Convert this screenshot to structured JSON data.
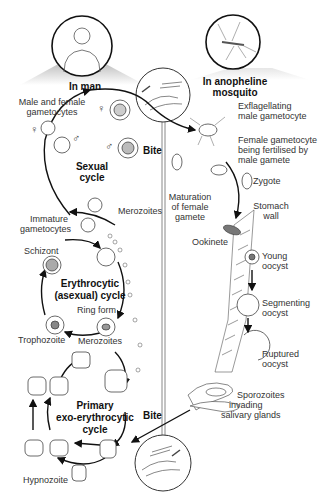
{
  "headers": {
    "man": "In man",
    "mosquito_line1": "In anopheline",
    "mosquito_line2": "mosquito"
  },
  "cycles": {
    "sexual_1": "Sexual",
    "sexual_2": "cycle",
    "erythro_1": "Erythrocytic",
    "erythro_2": "(asexual) cycle",
    "primary_1": "Primary",
    "primary_2": "exo-erythrocytic",
    "primary_3": "cycle"
  },
  "labels": {
    "gametocytes_1": "Male and female",
    "gametocytes_2": "gametocytes",
    "bite_top": "Bite",
    "bite_bottom": "Bite",
    "immature_1": "Immature",
    "immature_2": "gametocytes",
    "merozoites_top": "Merozoites",
    "schizont": "Schizont",
    "ring_form": "Ring form",
    "trophozoite": "Trophozoite",
    "merozoites_bottom": "Merozoites",
    "hypnozoite": "Hypnozoite",
    "exflag_1": "Exflagellating",
    "exflag_2": "male gametocyte",
    "female_1": "Female gametocyte",
    "female_2": "being fertilised by",
    "female_3": "male gamete",
    "zygote": "Zygote",
    "maturation_1": "Maturation",
    "maturation_2": "of female",
    "maturation_3": "gamete",
    "stomach_1": "Stomach",
    "stomach_2": "wall",
    "ookinete": "Ookinete",
    "young_1": "Young",
    "young_2": "oocyst",
    "segmenting_1": "Segmenting",
    "segmenting_2": "oocyst",
    "ruptured_1": "Ruptured",
    "ruptured_2": "oocyst",
    "sporozoites_1": "Sporozoites",
    "sporozoites_2": "invading",
    "sporozoites_3": "salivary glands"
  },
  "symbols": {
    "female": "♀",
    "male": "♂"
  }
}
